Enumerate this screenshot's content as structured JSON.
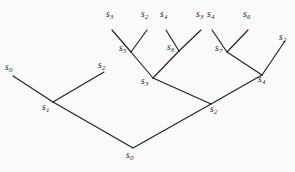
{
  "figure": {
    "name": "binary-tree-diagram",
    "background_color": "#fbfafa",
    "line_color": "#231f20",
    "width": 295,
    "height": 172
  },
  "nodes": [
    {
      "id": "leaf-s3-a",
      "symbol": "s",
      "subscript": "3",
      "x": 112,
      "y": 30,
      "label_x": 106,
      "label_y": 10,
      "kind": "leaf"
    },
    {
      "id": "leaf-s2-a",
      "symbol": "s",
      "subscript": "2",
      "x": 147,
      "y": 30,
      "label_x": 141,
      "label_y": 10,
      "kind": "leaf"
    },
    {
      "id": "leaf-s4-a",
      "symbol": "s",
      "subscript": "4",
      "x": 166,
      "y": 30,
      "label_x": 160,
      "label_y": 10,
      "kind": "leaf"
    },
    {
      "id": "leaf-s3-b",
      "symbol": "s",
      "subscript": "3",
      "x": 201,
      "y": 30,
      "label_x": 196,
      "label_y": 10,
      "kind": "leaf"
    },
    {
      "id": "leaf-s4-b",
      "symbol": "s",
      "subscript": "4",
      "x": 212,
      "y": 30,
      "label_x": 207,
      "label_y": 10,
      "kind": "leaf"
    },
    {
      "id": "leaf-s6-b",
      "symbol": "s",
      "subscript": "6",
      "x": 248,
      "y": 30,
      "label_x": 243,
      "label_y": 10,
      "kind": "leaf"
    },
    {
      "id": "node-s5",
      "symbol": "s",
      "subscript": "5",
      "x": 131,
      "y": 52,
      "label_x": 119,
      "label_y": 44,
      "kind": "internal"
    },
    {
      "id": "node-s6",
      "symbol": "s",
      "subscript": "6",
      "x": 179,
      "y": 51,
      "label_x": 167,
      "label_y": 43,
      "kind": "internal"
    },
    {
      "id": "node-s7",
      "symbol": "s",
      "subscript": "7",
      "x": 227,
      "y": 52,
      "label_x": 215,
      "label_y": 44,
      "kind": "internal"
    },
    {
      "id": "leaf-s2-c",
      "symbol": "s",
      "subscript": "2",
      "x": 285,
      "y": 41,
      "label_x": 279,
      "label_y": 33,
      "kind": "leaf"
    },
    {
      "id": "leaf-s0-l",
      "symbol": "s",
      "subscript": "0",
      "x": 13,
      "y": 76,
      "label_x": 5,
      "label_y": 63,
      "kind": "leaf"
    },
    {
      "id": "leaf-s2-l",
      "symbol": "s",
      "subscript": "2",
      "x": 104,
      "y": 72,
      "label_x": 98,
      "label_y": 61,
      "kind": "leaf"
    },
    {
      "id": "node-s3",
      "symbol": "s",
      "subscript": "3",
      "x": 153,
      "y": 78,
      "label_x": 141,
      "label_y": 77,
      "kind": "internal"
    },
    {
      "id": "node-s4",
      "symbol": "s",
      "subscript": "4",
      "x": 262,
      "y": 75,
      "label_x": 258,
      "label_y": 75,
      "kind": "internal"
    },
    {
      "id": "node-s1",
      "symbol": "s",
      "subscript": "1",
      "x": 53,
      "y": 102,
      "label_x": 42,
      "label_y": 103,
      "kind": "internal"
    },
    {
      "id": "node-s2",
      "symbol": "s",
      "subscript": "2",
      "x": 211,
      "y": 104,
      "label_x": 210,
      "label_y": 105,
      "kind": "internal"
    },
    {
      "id": "root-s0",
      "symbol": "s",
      "subscript": "0",
      "x": 133,
      "y": 148,
      "label_x": 126,
      "label_y": 151,
      "kind": "root"
    }
  ],
  "edges": [
    {
      "id": "edge-s3a-s5",
      "from": "leaf-s3-a",
      "to": "node-s5",
      "x1": 112,
      "y1": 30,
      "x2": 131,
      "y2": 52
    },
    {
      "id": "edge-s2a-s5",
      "from": "leaf-s2-a",
      "to": "node-s5",
      "x1": 147,
      "y1": 30,
      "x2": 131,
      "y2": 52
    },
    {
      "id": "edge-s4a-s6",
      "from": "leaf-s4-a",
      "to": "node-s6",
      "x1": 166,
      "y1": 30,
      "x2": 179,
      "y2": 51
    },
    {
      "id": "edge-s3b-s6",
      "from": "leaf-s3-b",
      "to": "node-s6",
      "x1": 201,
      "y1": 30,
      "x2": 179,
      "y2": 51
    },
    {
      "id": "edge-s4b-s7",
      "from": "leaf-s4-b",
      "to": "node-s7",
      "x1": 212,
      "y1": 30,
      "x2": 227,
      "y2": 52
    },
    {
      "id": "edge-s6b-s7",
      "from": "leaf-s6-b",
      "to": "node-s7",
      "x1": 248,
      "y1": 30,
      "x2": 227,
      "y2": 52
    },
    {
      "id": "edge-s5-s3",
      "from": "node-s5",
      "to": "node-s3",
      "x1": 131,
      "y1": 52,
      "x2": 153,
      "y2": 78
    },
    {
      "id": "edge-s6-s3",
      "from": "node-s6",
      "to": "node-s3",
      "x1": 179,
      "y1": 51,
      "x2": 153,
      "y2": 78
    },
    {
      "id": "edge-s7-s4",
      "from": "node-s7",
      "to": "node-s4",
      "x1": 227,
      "y1": 52,
      "x2": 262,
      "y2": 75
    },
    {
      "id": "edge-s2c-s4",
      "from": "leaf-s2-c",
      "to": "node-s4",
      "x1": 285,
      "y1": 41,
      "x2": 262,
      "y2": 75
    },
    {
      "id": "edge-s0l-s1",
      "from": "leaf-s0-l",
      "to": "node-s1",
      "x1": 13,
      "y1": 76,
      "x2": 53,
      "y2": 102
    },
    {
      "id": "edge-s2l-s1",
      "from": "leaf-s2-l",
      "to": "node-s1",
      "x1": 104,
      "y1": 72,
      "x2": 53,
      "y2": 102
    },
    {
      "id": "edge-s3-s2",
      "from": "node-s3",
      "to": "node-s2",
      "x1": 153,
      "y1": 78,
      "x2": 211,
      "y2": 104
    },
    {
      "id": "edge-s4-s2",
      "from": "node-s4",
      "to": "node-s2",
      "x1": 262,
      "y1": 75,
      "x2": 211,
      "y2": 104
    },
    {
      "id": "edge-s1-root",
      "from": "node-s1",
      "to": "root-s0",
      "x1": 53,
      "y1": 102,
      "x2": 133,
      "y2": 148
    },
    {
      "id": "edge-s2-root",
      "from": "node-s2",
      "to": "root-s0",
      "x1": 211,
      "y1": 104,
      "x2": 133,
      "y2": 148
    }
  ]
}
